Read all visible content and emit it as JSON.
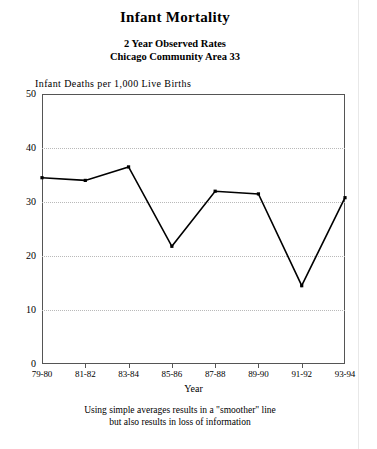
{
  "title": "Infant Mortality",
  "subtitle_1": "2 Year Observed Rates",
  "subtitle_2": "Chicago Community Area 33",
  "axis_note": "Infant  Deaths  per  1,000  Live  Births",
  "x_axis_title": "Year",
  "footnote_line_1": "Using simple averages results in a \"smoother\" line",
  "footnote_line_2": "but also results in loss of information",
  "colors": {
    "line": "#000000",
    "frame": "#555555",
    "grid": "#b9b9b9",
    "background": "#ffffff"
  },
  "chart_data": {
    "type": "line",
    "title": "Infant Mortality",
    "subtitle": "2 Year Observed Rates — Chicago Community Area 33",
    "xlabel": "Year",
    "ylabel": "Infant Deaths per 1,000 Live Births",
    "categories": [
      "79-80",
      "81-82",
      "83-84",
      "85-86",
      "87-88",
      "89-90",
      "91-92",
      "93-94"
    ],
    "values": [
      34.5,
      34.0,
      36.5,
      21.8,
      32.0,
      31.5,
      14.5,
      30.8
    ],
    "series": [
      {
        "name": "2 Year Observed Rate",
        "values": [
          34.5,
          34.0,
          36.5,
          21.8,
          32.0,
          31.5,
          14.5,
          30.8
        ]
      }
    ],
    "ylim": [
      0,
      50
    ],
    "yticks": [
      0,
      10,
      20,
      30,
      40,
      50
    ],
    "ytick_labels": [
      "0",
      "10",
      "20",
      "30",
      "40",
      "50"
    ],
    "xtick_labels": [
      "79-80",
      "81-82",
      "83-84",
      "85-86",
      "87-88",
      "89-90",
      "91-92",
      "93-94"
    ],
    "grid": "horizontal-dotted",
    "gridlines_at": [
      10,
      20,
      30,
      40
    ],
    "legend": "none",
    "markers": true,
    "annotations": [
      "Using simple averages results in a \"smoother\" line",
      "but also results in loss of information"
    ]
  }
}
